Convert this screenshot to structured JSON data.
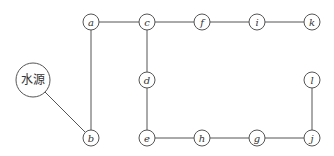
{
  "diagram": {
    "type": "network-graph",
    "source": {
      "id": "source",
      "label": "水源",
      "x": 33,
      "y": 80,
      "r": 17
    },
    "nodes": [
      {
        "id": "a",
        "label": "a",
        "x": 91,
        "y": 22
      },
      {
        "id": "c",
        "label": "c",
        "x": 147,
        "y": 22
      },
      {
        "id": "f",
        "label": "f",
        "x": 202,
        "y": 22
      },
      {
        "id": "i",
        "label": "i",
        "x": 257,
        "y": 22
      },
      {
        "id": "k",
        "label": "k",
        "x": 312,
        "y": 22
      },
      {
        "id": "d",
        "label": "d",
        "x": 147,
        "y": 80
      },
      {
        "id": "l",
        "label": "l",
        "x": 312,
        "y": 80
      },
      {
        "id": "b",
        "label": "b",
        "x": 91,
        "y": 138
      },
      {
        "id": "e",
        "label": "e",
        "x": 147,
        "y": 138
      },
      {
        "id": "h",
        "label": "h",
        "x": 202,
        "y": 138
      },
      {
        "id": "g",
        "label": "g",
        "x": 257,
        "y": 138
      },
      {
        "id": "j",
        "label": "j",
        "x": 312,
        "y": 138
      }
    ],
    "node_radius": 8,
    "edges": [
      [
        "source",
        "b"
      ],
      [
        "b",
        "a"
      ],
      [
        "a",
        "c"
      ],
      [
        "c",
        "f"
      ],
      [
        "f",
        "i"
      ],
      [
        "i",
        "k"
      ],
      [
        "c",
        "d"
      ],
      [
        "d",
        "e"
      ],
      [
        "e",
        "h"
      ],
      [
        "h",
        "g"
      ],
      [
        "g",
        "j"
      ],
      [
        "j",
        "l"
      ]
    ],
    "colors": {
      "stroke": "#555555",
      "text": "#333333",
      "background": "#ffffff"
    }
  }
}
